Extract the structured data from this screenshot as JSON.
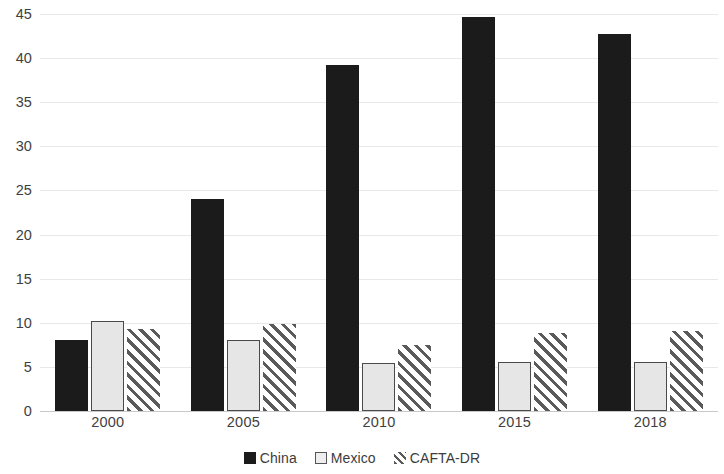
{
  "chart_data": {
    "type": "bar",
    "title": "",
    "subtitle": "",
    "xlabel": "",
    "ylabel": "",
    "categories": [
      "2000",
      "2005",
      "2010",
      "2015",
      "2018"
    ],
    "series": [
      {
        "name": "China",
        "values": [
          8.1,
          24.0,
          39.2,
          44.7,
          42.7
        ],
        "color": "#1b1b1b",
        "fill": "solid"
      },
      {
        "name": "Mexico",
        "values": [
          10.2,
          8.1,
          5.4,
          5.5,
          5.5
        ],
        "color": "#e6e6e6",
        "fill": "light-outlined"
      },
      {
        "name": "CAFTA-DR",
        "values": [
          9.3,
          9.9,
          7.5,
          8.8,
          9.1
        ],
        "color": "#5a5a5a",
        "fill": "diagonal-hatch"
      }
    ],
    "ylim": [
      0,
      45
    ],
    "ytick_step": 5,
    "yticks": [
      "45",
      "40",
      "35",
      "30",
      "25",
      "20",
      "15",
      "10",
      "5",
      "0"
    ],
    "grid": true,
    "legend_position": "bottom"
  },
  "legend": {
    "items": [
      {
        "label": "China",
        "swatch": "legend-swatch-solid-black"
      },
      {
        "label": "Mexico",
        "swatch": "legend-swatch-outlined-light"
      },
      {
        "label": "CAFTA-DR",
        "swatch": "legend-swatch-hatched"
      }
    ]
  }
}
